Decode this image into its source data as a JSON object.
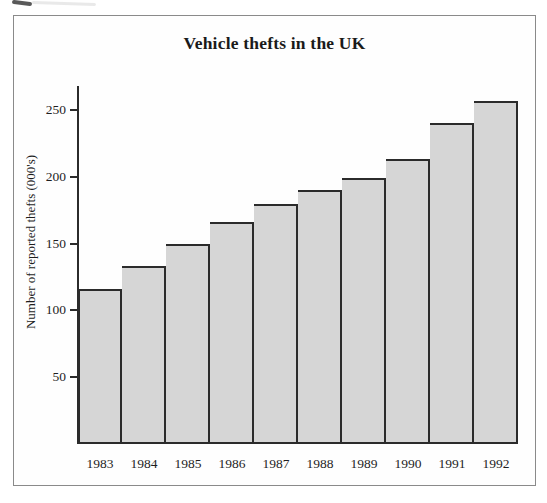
{
  "chart_data": {
    "type": "bar",
    "title": "Vehicle thefts in the UK",
    "categories": [
      "1983",
      "1984",
      "1985",
      "1986",
      "1987",
      "1988",
      "1989",
      "1990",
      "1991",
      "1992"
    ],
    "values": [
      116,
      133,
      150,
      166,
      180,
      190,
      199,
      213,
      240,
      257
    ],
    "xlabel": "",
    "ylabel": "Number of reported thefts (000's)",
    "ylim": [
      0,
      268
    ],
    "yticks": [
      50,
      100,
      150,
      200,
      250
    ],
    "grid": false,
    "legend": false,
    "bar_fill_color": "#d6d6d6",
    "bar_border_color": "#2b2b2b",
    "axis_color": "#2b2b2b",
    "text_color": "#1e1e1e"
  }
}
